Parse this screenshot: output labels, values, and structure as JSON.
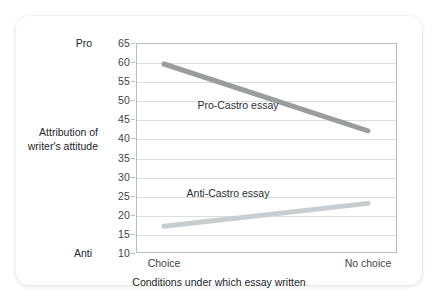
{
  "chart_data": {
    "type": "line",
    "title": "",
    "xlabel": "Conditions under which essay written",
    "ylabel": "Attribution of writer's attitude",
    "categories": [
      "Choice",
      "No choice"
    ],
    "ylim": [
      10,
      65
    ],
    "yticks": [
      10,
      15,
      20,
      25,
      30,
      35,
      40,
      45,
      50,
      55,
      60,
      65
    ],
    "ytick_labels": [
      "10",
      "15",
      "20",
      "25",
      "30",
      "35",
      "40",
      "45",
      "50",
      "55",
      "60",
      "65"
    ],
    "y_pole_low_label": "Anti",
    "y_pole_high_label": "Pro",
    "grid": true,
    "legend_position": "inline-annotation",
    "series": [
      {
        "name": "Pro-Castro essay",
        "values": [
          59.5,
          42.0
        ],
        "color": "#9a9c9e",
        "annotation": "Pro-Castro essay"
      },
      {
        "name": "Anti-Castro essay",
        "values": [
          17.0,
          23.0
        ],
        "color": "#cacdcf",
        "annotation": "Anti-Castro essay"
      }
    ]
  },
  "axis": {
    "y_title_line1": "Attribution of",
    "y_title_line2": "writer's attitude"
  }
}
